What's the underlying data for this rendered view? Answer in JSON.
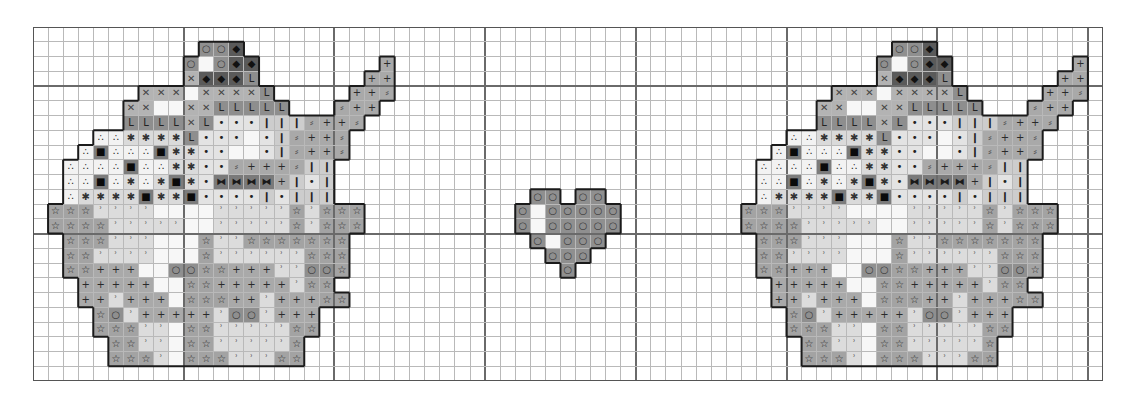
{
  "pattern": {
    "title": "Cupcake cross-stitch chart",
    "grid": {
      "cols": 71,
      "rows": 24,
      "cell_width": 15.07,
      "cell_height": 14.75,
      "major_every": 10,
      "major_col_offset": 0,
      "major_row_offset": 4
    },
    "symbols": {
      "O": {
        "name": "circle",
        "glyph": "○",
        "bg": "#8f8f8f",
        "fg": "#3a3a3a"
      },
      "D": {
        "name": "diamond-dark",
        "glyph": "◆",
        "bg": "#5a5a5a",
        "fg": "#111111"
      },
      "X": {
        "name": "cross",
        "glyph": "✕",
        "bg": "#b3b3b3",
        "fg": "#444444"
      },
      "L": {
        "name": "ell",
        "glyph": "L",
        "bg": "#8e8e8e",
        "fg": "#222222"
      },
      "w": {
        "name": "white",
        "glyph": "",
        "bg": "#f7f7f7",
        "fg": "#333333"
      },
      "b": {
        "name": "dot",
        "glyph": "•",
        "bg": "#e3e3e3",
        "fg": "#222222"
      },
      "I": {
        "name": "bar",
        "glyph": "❙",
        "bg": "#cdcdcd",
        "fg": "#222222"
      },
      "!": {
        "name": "spoon-edge",
        "glyph": "⸗",
        "bg": "#a9a9a9",
        "fg": "#555555"
      },
      "+": {
        "name": "plus",
        "glyph": "+",
        "bg": "#a9a9a9",
        "fg": "#2a2a2a"
      },
      "T": {
        "name": "triad",
        "glyph": "∴",
        "bg": "#f2f2f2",
        "fg": "#222222"
      },
      "A": {
        "name": "asterisk",
        "glyph": "✱",
        "bg": "#dadada",
        "fg": "#333333"
      },
      "S": {
        "name": "square",
        "glyph": "■",
        "bg": "#7c7c7c",
        "fg": "#0a0a0a"
      },
      "B": {
        "name": "bowtie",
        "glyph": "⧓",
        "bg": "#7a7a7a",
        "fg": "#1a1a1a"
      },
      "s": {
        "name": "star",
        "glyph": "☆",
        "bg": "#a3a3a3",
        "fg": "#222222"
      },
      "q": {
        "name": "tick",
        "glyph": "ʾ",
        "bg": "#dcdcdc",
        "fg": "#555555"
      }
    },
    "motifs": [
      {
        "name": "cupcake-left",
        "col_offset": 0,
        "row_offset": 0,
        "rows": [
          ".........................",
          "...........OOD...........",
          "..........OwODD........+.",
          "..........XDDDL.......++.",
          ".......XXXwXXXXL.....++!.",
          "......XXwwXXLLLLL...!++..",
          "......LLLLXLbbbIII!++!...",
          "....TTAAAALbbbwbI!++!....",
          "...TSTTTSAAbbwwbI!++!....",
          "..TTTTSTTAAbb!+++!II.....",
          "..TTSTATASAbBBBB+IbI.....",
          "..TAAAASAASbbbbIbIII.....",
          ".sssqqqqwwwwqqqqqsqsss...",
          ".ssssqqqqqwwqqqqqsqsss...",
          "..sssqqqwwwsqqsssssss....",
          "..ssqqqqwwwsqqqqqqsss....",
          "..ss+++wwOOss+++qqOOs....",
          "...+++++wwss+++++qss.....",
          "...++q+++wsss++q+++ss....",
          "....sOq+++++qOOq+++......",
          "....sssqqwssqqqqqss......",
          ".....ssqqwssqqqqqs.......",
          ".....sssqwsssqqqss.......",
          "........................."
        ]
      },
      {
        "name": "heart",
        "col_offset": 30,
        "row_offset": 0,
        "rows": [
          ".........",
          ".........",
          ".........",
          ".........",
          ".........",
          ".........",
          ".........",
          ".........",
          ".........",
          ".........",
          ".........",
          "...OO.OO.",
          "..OwOOOOO",
          "..OwOOOOO",
          "...OwOOO.",
          "....OOO..",
          ".....O...",
          "........."
        ]
      },
      {
        "name": "cupcake-right",
        "col_offset": 46,
        "row_offset": 0,
        "rows": [
          ".........................",
          "...........OOD...........",
          "..........OwODD........+.",
          "..........XDDDL.......++.",
          ".......XXXwXXXXL.....++!.",
          "......XXwwXXLLLLL...!++..",
          "......LLLLXLbbbIII!++!...",
          "....TTAAAALbbbwbI!++!....",
          "...TSTTTSAAbbwwbI!++!....",
          "..TTTTSTTAAbb!+++!II.....",
          "..TTSTATASAbBBBB+IbI.....",
          "..TAAAASAASbbbbIbIII.....",
          ".sssqqqqwwwwqqqqqsqsss...",
          ".ssssqqqqqwwqqqqqsqsss...",
          "..sssqqqwwwsqqsssssss....",
          "..ssqqqqwwwsqqqqqqsss....",
          "..ss+++wwOOss+++qqOOs....",
          "...+++++wwss+++++qss.....",
          "...++q+++wsss++q+++ss....",
          "....sOq+++++qOOq+++......",
          "....sssqqwssqqqqqss......",
          ".....ssqqwssqqqqqs.......",
          ".....sssqwsssqqqss.......",
          "........................."
        ]
      }
    ]
  }
}
